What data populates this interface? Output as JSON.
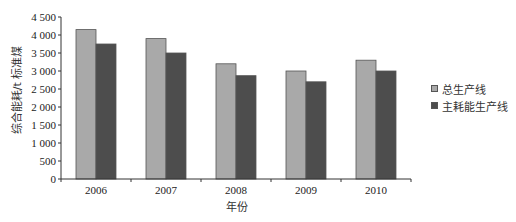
{
  "chart_data": {
    "type": "bar",
    "title": "",
    "xlabel": "年份",
    "ylabel": "综合能耗/t 标准煤",
    "categories": [
      "2006",
      "2007",
      "2008",
      "2009",
      "2010"
    ],
    "series": [
      {
        "name": "总生产线",
        "color": "#a9a9a9",
        "values": [
          4150,
          3900,
          3200,
          3000,
          3300
        ]
      },
      {
        "name": "主耗能生产线",
        "color": "#4d4d4d",
        "values": [
          3750,
          3500,
          2870,
          2700,
          3000
        ]
      }
    ],
    "ylim": [
      0,
      4500
    ],
    "yticks": [
      0,
      500,
      1000,
      1500,
      2000,
      2500,
      3000,
      3500,
      4000,
      4500
    ],
    "ytick_labels": [
      "0",
      "500",
      "1 000",
      "1 500",
      "2 000",
      "2 500",
      "3 000",
      "3 500",
      "4 000",
      "4 500"
    ],
    "grid": false,
    "legend_position": "right"
  }
}
